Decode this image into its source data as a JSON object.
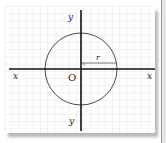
{
  "diagram": {
    "type": "circle-on-coordinate-grid",
    "labels": {
      "x_left": "x",
      "x_right": "x",
      "y_top": "y",
      "y_bottom": "y",
      "origin": "O",
      "radius": "r"
    },
    "colors": {
      "grid": "#d4d4d4",
      "axis": "#111111",
      "circle": "#444444",
      "paper": "#ffffff",
      "shadow": "#b0b0b0"
    }
  }
}
